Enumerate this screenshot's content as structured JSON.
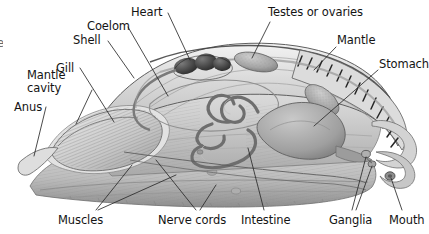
{
  "figure": {
    "style": "grayscale pencil/airbrush scientific illustration",
    "background_color": "#ffffff",
    "ink_color": "#141414",
    "leader_line_color": "#2a2a2a",
    "edge_fragment": "e"
  },
  "labels": [
    {
      "id": "heart",
      "text": "Heart",
      "x": 131,
      "y": 6,
      "align": "left"
    },
    {
      "id": "coelom",
      "text": "Coelom",
      "x": 87,
      "y": 20,
      "align": "left"
    },
    {
      "id": "shell",
      "text": "Shell",
      "x": 73,
      "y": 34,
      "align": "left"
    },
    {
      "id": "gill",
      "text": "Gill",
      "x": 56,
      "y": 62,
      "align": "left"
    },
    {
      "id": "mantle-cavity",
      "text": "Mantle cavity",
      "x": 27,
      "y": 74,
      "align": "left",
      "multiline": true
    },
    {
      "id": "anus",
      "text": "Anus",
      "x": 14,
      "y": 101,
      "align": "left"
    },
    {
      "id": "testes-or-ovaries",
      "text": "Testes or ovaries",
      "x": 268,
      "y": 6,
      "align": "left"
    },
    {
      "id": "mantle",
      "text": "Mantle",
      "x": 337,
      "y": 34,
      "align": "left"
    },
    {
      "id": "stomach",
      "text": "Stomach",
      "x": 379,
      "y": 58,
      "align": "left"
    },
    {
      "id": "muscles",
      "text": "Muscles",
      "x": 58,
      "y": 215,
      "align": "left"
    },
    {
      "id": "nerve-cords",
      "text": "Nerve cords",
      "x": 158,
      "y": 215,
      "align": "left"
    },
    {
      "id": "intestine",
      "text": "Intestine",
      "x": 241,
      "y": 215,
      "align": "left"
    },
    {
      "id": "ganglia",
      "text": "Ganglia",
      "x": 329,
      "y": 215,
      "align": "left"
    },
    {
      "id": "mouth",
      "text": "Mouth",
      "x": 389,
      "y": 215,
      "align": "left"
    }
  ],
  "structures": [
    {
      "id": "shell",
      "name": "Shell",
      "description": "arched dome with banded serrated margin at right"
    },
    {
      "id": "mantle",
      "name": "Mantle",
      "description": "tissue layer just inside shell rim"
    },
    {
      "id": "coelom",
      "name": "Coelom",
      "description": "body cavity around heart"
    },
    {
      "id": "heart",
      "name": "Heart",
      "description": "dark lobed organ upper centre"
    },
    {
      "id": "gonad",
      "name": "Testes or ovaries",
      "description": "stippled ovoid organ upper right of heart"
    },
    {
      "id": "stomach",
      "name": "Stomach",
      "description": "large pale mass right side"
    },
    {
      "id": "intestine",
      "name": "Intestine",
      "description": "coiled tube centre"
    },
    {
      "id": "gill",
      "name": "Gill",
      "description": "finely striated leaf-shaped ctenidium left"
    },
    {
      "id": "mantle-cavity",
      "name": "Mantle cavity",
      "description": "space enclosing the gill"
    },
    {
      "id": "anus",
      "name": "Anus",
      "description": "pointed tube at far left"
    },
    {
      "id": "muscles",
      "name": "Muscles",
      "description": "large striated foot mass lower half"
    },
    {
      "id": "nerve-cords",
      "name": "Nerve cords",
      "description": "thin paired lines running length of foot"
    },
    {
      "id": "ganglia",
      "name": "Ganglia",
      "description": "small nodules near mouth, right"
    },
    {
      "id": "mouth",
      "name": "Mouth",
      "description": "opening at right end near flared lip"
    }
  ]
}
